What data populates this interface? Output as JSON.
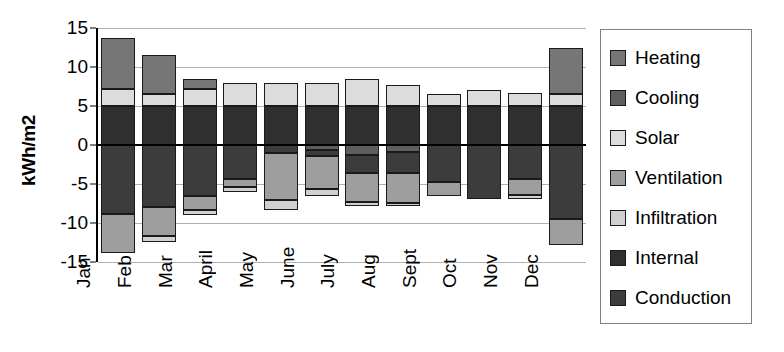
{
  "chart_data": {
    "type": "bar",
    "subtype": "stacked-bar-diverging",
    "title": "",
    "xlabel": "",
    "ylabel": "kWh/m2",
    "ylim": [
      -15,
      15
    ],
    "yticks": [
      15,
      10,
      5,
      0,
      -5,
      -10,
      -15
    ],
    "ytick_labels": [
      "15",
      "10",
      "5",
      "0",
      "-5",
      "-10",
      "-15"
    ],
    "grid": true,
    "legend_position": "right",
    "categories": [
      "Jan",
      "Feb",
      "Mar",
      "April",
      "May",
      "June",
      "July",
      "Aug",
      "Sept",
      "Oct",
      "Nov",
      "Dec"
    ],
    "series": [
      {
        "name": "Heating",
        "color": "#767676",
        "values": [
          6.5,
          4.9,
          1.3,
          0.0,
          0.0,
          0.0,
          0.0,
          0.0,
          0.0,
          0.0,
          0.0,
          5.9
        ]
      },
      {
        "name": "Cooling",
        "color": "#5e5e5e",
        "values": [
          0.0,
          0.0,
          0.0,
          0.0,
          0.0,
          -0.6,
          -1.3,
          -0.9,
          0.0,
          0.0,
          0.0,
          0.0
        ]
      },
      {
        "name": "Solar",
        "color": "#dcdcdc",
        "values": [
          2.2,
          1.6,
          2.2,
          2.9,
          3.0,
          2.9,
          3.4,
          2.7,
          1.5,
          2.0,
          1.7,
          1.5
        ]
      },
      {
        "name": "Ventilation",
        "color": "#9e9e9e",
        "values": [
          -5.1,
          -3.7,
          -1.7,
          -1.1,
          -6.0,
          -4.2,
          -3.7,
          -3.8,
          -1.9,
          0.0,
          -2.1,
          -3.3
        ]
      },
      {
        "name": "Infiltration",
        "color": "#d0d0d0",
        "values": [
          0.0,
          0.0,
          -0.7,
          -0.6,
          -1.3,
          -0.9,
          -0.5,
          -0.4,
          0.0,
          0.0,
          -0.5,
          0.0
        ]
      },
      {
        "name": "Internal",
        "color": "#2f2f2f",
        "values": [
          5.0,
          5.0,
          5.0,
          5.0,
          5.0,
          5.0,
          5.0,
          5.0,
          5.0,
          5.0,
          5.0,
          5.0
        ]
      },
      {
        "name": "Conduction",
        "color": "#3c3c3c",
        "values": [
          -8.8,
          -8.0,
          -6.6,
          -4.3,
          -1.0,
          -0.8,
          -2.3,
          -2.7,
          -4.7,
          -6.9,
          -4.3,
          -9.5
        ]
      }
    ],
    "bars": [
      {
        "category": "Jan",
        "positive": [
          {
            "series": "Internal",
            "from": 0,
            "to": 5
          },
          {
            "series": "Solar",
            "from": 5,
            "to": 7.2
          },
          {
            "series": "Heating",
            "from": 7.2,
            "to": 13.7
          }
        ],
        "negative": [
          {
            "series": "Conduction",
            "from": 0,
            "to": -8.8
          },
          {
            "series": "Ventilation",
            "from": -8.8,
            "to": -13.9
          }
        ]
      },
      {
        "category": "Feb",
        "positive": [
          {
            "series": "Internal",
            "from": 0,
            "to": 5
          },
          {
            "series": "Solar",
            "from": 5,
            "to": 6.6
          },
          {
            "series": "Heating",
            "from": 6.6,
            "to": 11.5
          }
        ],
        "negative": [
          {
            "series": "Conduction",
            "from": 0,
            "to": -8.0
          },
          {
            "series": "Ventilation",
            "from": -8.0,
            "to": -11.7
          },
          {
            "series": "Infiltration",
            "from": -11.7,
            "to": -12.4
          }
        ]
      },
      {
        "category": "Mar",
        "positive": [
          {
            "series": "Internal",
            "from": 0,
            "to": 5
          },
          {
            "series": "Solar",
            "from": 5,
            "to": 7.2
          },
          {
            "series": "Heating",
            "from": 7.2,
            "to": 8.5
          }
        ],
        "negative": [
          {
            "series": "Conduction",
            "from": 0,
            "to": -6.6
          },
          {
            "series": "Ventilation",
            "from": -6.6,
            "to": -8.3
          },
          {
            "series": "Infiltration",
            "from": -8.3,
            "to": -9.0
          }
        ]
      },
      {
        "category": "April",
        "positive": [
          {
            "series": "Internal",
            "from": 0,
            "to": 5
          },
          {
            "series": "Solar",
            "from": 5,
            "to": 7.9
          }
        ],
        "negative": [
          {
            "series": "Conduction",
            "from": 0,
            "to": -4.3
          },
          {
            "series": "Ventilation",
            "from": -4.3,
            "to": -5.4
          },
          {
            "series": "Infiltration",
            "from": -5.4,
            "to": -6.0
          }
        ]
      },
      {
        "category": "May",
        "positive": [
          {
            "series": "Internal",
            "from": 0,
            "to": 5
          },
          {
            "series": "Solar",
            "from": 5,
            "to": 8.0
          }
        ],
        "negative": [
          {
            "series": "Conduction",
            "from": 0,
            "to": -1.0
          },
          {
            "series": "Ventilation",
            "from": -1.0,
            "to": -7.0
          },
          {
            "series": "Infiltration",
            "from": -7.0,
            "to": -8.3
          }
        ]
      },
      {
        "category": "June",
        "positive": [
          {
            "series": "Internal",
            "from": 0,
            "to": 5
          },
          {
            "series": "Solar",
            "from": 5,
            "to": 7.9
          }
        ],
        "negative": [
          {
            "series": "Cooling",
            "from": 0,
            "to": -0.6
          },
          {
            "series": "Conduction",
            "from": -0.6,
            "to": -1.4
          },
          {
            "series": "Ventilation",
            "from": -1.4,
            "to": -5.6
          },
          {
            "series": "Infiltration",
            "from": -5.6,
            "to": -6.5
          }
        ]
      },
      {
        "category": "July",
        "positive": [
          {
            "series": "Internal",
            "from": 0,
            "to": 5
          },
          {
            "series": "Solar",
            "from": 5,
            "to": 8.4
          }
        ],
        "negative": [
          {
            "series": "Cooling",
            "from": 0,
            "to": -1.3
          },
          {
            "series": "Conduction",
            "from": -1.3,
            "to": -3.6
          },
          {
            "series": "Ventilation",
            "from": -3.6,
            "to": -7.3
          },
          {
            "series": "Infiltration",
            "from": -7.3,
            "to": -7.8
          }
        ]
      },
      {
        "category": "Aug",
        "positive": [
          {
            "series": "Internal",
            "from": 0,
            "to": 5
          },
          {
            "series": "Solar",
            "from": 5,
            "to": 7.7
          }
        ],
        "negative": [
          {
            "series": "Cooling",
            "from": 0,
            "to": -0.9
          },
          {
            "series": "Conduction",
            "from": -0.9,
            "to": -3.6
          },
          {
            "series": "Ventilation",
            "from": -3.6,
            "to": -7.4
          },
          {
            "series": "Infiltration",
            "from": -7.4,
            "to": -7.8
          }
        ]
      },
      {
        "category": "Sept",
        "positive": [
          {
            "series": "Internal",
            "from": 0,
            "to": 5
          },
          {
            "series": "Solar",
            "from": 5,
            "to": 6.5
          }
        ],
        "negative": [
          {
            "series": "Conduction",
            "from": 0,
            "to": -4.7
          },
          {
            "series": "Ventilation",
            "from": -4.7,
            "to": -6.6
          }
        ]
      },
      {
        "category": "Oct",
        "positive": [
          {
            "series": "Internal",
            "from": 0,
            "to": 5
          },
          {
            "series": "Solar",
            "from": 5,
            "to": 7.0
          }
        ],
        "negative": [
          {
            "series": "Conduction",
            "from": 0,
            "to": -6.9
          }
        ]
      },
      {
        "category": "Nov",
        "positive": [
          {
            "series": "Internal",
            "from": 0,
            "to": 5
          },
          {
            "series": "Solar",
            "from": 5,
            "to": 6.7
          }
        ],
        "negative": [
          {
            "series": "Conduction",
            "from": 0,
            "to": -4.3
          },
          {
            "series": "Ventilation",
            "from": -4.3,
            "to": -6.4
          },
          {
            "series": "Infiltration",
            "from": -6.4,
            "to": -6.9
          }
        ]
      },
      {
        "category": "Dec",
        "positive": [
          {
            "series": "Internal",
            "from": 0,
            "to": 5
          },
          {
            "series": "Solar",
            "from": 5,
            "to": 6.5
          },
          {
            "series": "Heating",
            "from": 6.5,
            "to": 12.4
          }
        ],
        "negative": [
          {
            "series": "Conduction",
            "from": 0,
            "to": -9.5
          },
          {
            "series": "Ventilation",
            "from": -9.5,
            "to": -12.8
          }
        ]
      }
    ]
  },
  "legend": {
    "items": [
      {
        "label": "Heating",
        "color": "#767676"
      },
      {
        "label": "Cooling",
        "color": "#5e5e5e"
      },
      {
        "label": "Solar",
        "color": "#dcdcdc"
      },
      {
        "label": "Ventilation",
        "color": "#9e9e9e"
      },
      {
        "label": "Infiltration",
        "color": "#d0d0d0"
      },
      {
        "label": "Internal",
        "color": "#2f2f2f"
      },
      {
        "label": "Conduction",
        "color": "#3c3c3c"
      }
    ]
  },
  "colors": {
    "gridline": "#b0b0b0",
    "axis": "#000000",
    "legend_border": "#808080",
    "background": "#ffffff"
  }
}
